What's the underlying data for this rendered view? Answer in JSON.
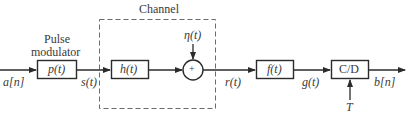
{
  "diagram": {
    "channel_label": "Channel",
    "modulator_label_line1": "Pulse",
    "modulator_label_line2": "modulator",
    "blocks": {
      "pulse": "p(t)",
      "channel_filter": "h(t)",
      "adder": "+",
      "receive_filter": "f(t)",
      "sampler": "C/D"
    },
    "signals": {
      "input": "a[n]",
      "modulated": "s(t)",
      "noise": "η(t)",
      "received": "r(t)",
      "filtered": "g(t)",
      "output": "b[n]",
      "sample_period": "T"
    },
    "colors": {
      "line": "#2b2b2b",
      "dashed_box": "#6a6a6a",
      "text": "#3a3a3a"
    }
  }
}
